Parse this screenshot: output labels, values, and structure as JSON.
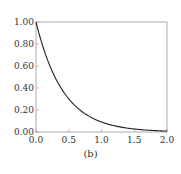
{
  "chart_data": {
    "type": "line",
    "title": "",
    "caption": "(b)",
    "xlabel": "",
    "ylabel": "",
    "xlim": [
      0.0,
      2.0
    ],
    "ylim": [
      0.0,
      1.0
    ],
    "x_ticks": [
      "0.0",
      "0.5",
      "1.0",
      "1.5",
      "2.0"
    ],
    "y_ticks": [
      "0.00",
      "0.20",
      "0.40",
      "0.60",
      "0.80",
      "1.00"
    ],
    "grid": false,
    "legend": null,
    "series": [
      {
        "name": "curve",
        "x": [
          0.0,
          0.1,
          0.2,
          0.3,
          0.4,
          0.5,
          0.6,
          0.7,
          0.8,
          0.9,
          1.0,
          1.2,
          1.4,
          1.6,
          1.8,
          2.0
        ],
        "y": [
          1.0,
          0.79,
          0.62,
          0.49,
          0.38,
          0.3,
          0.24,
          0.19,
          0.15,
          0.12,
          0.09,
          0.06,
          0.035,
          0.02,
          0.013,
          0.008
        ]
      }
    ]
  }
}
